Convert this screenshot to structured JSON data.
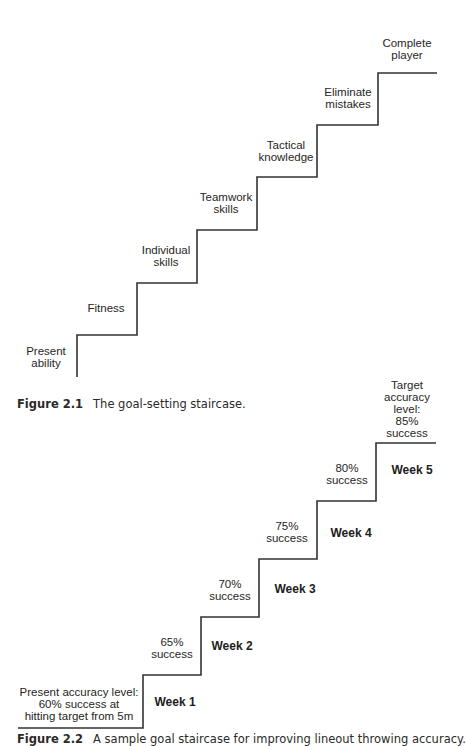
{
  "figure1": {
    "caption": {
      "number": "Figure 2.1",
      "text": "The goal-setting staircase."
    },
    "steps": [
      {
        "label": "Present\nability"
      },
      {
        "label": "Fitness"
      },
      {
        "label": "Individual\nskills"
      },
      {
        "label": "Teamwork\nskills"
      },
      {
        "label": "Tactical\nknowledge"
      },
      {
        "label": "Eliminate\nmistakes"
      },
      {
        "label": "Complete\nplayer"
      }
    ]
  },
  "figure2": {
    "caption": {
      "number": "Figure 2.2",
      "text": "A sample goal staircase for improving lineout throwing accuracy."
    },
    "start_label": "Present accuracy level:\n60% success at\nhitting target from 5m",
    "target_label": "Target\naccuracy\nlevel:\n85%\nsuccess",
    "steps": [
      {
        "week": "Week 1",
        "label": "65%\nsuccess"
      },
      {
        "week": "Week 2",
        "label": "70%\nsuccess"
      },
      {
        "week": "Week 3",
        "label": "75%\nsuccess"
      },
      {
        "week": "Week 4",
        "label": "80%\nsuccess"
      },
      {
        "week": "Week 5"
      }
    ]
  },
  "colors": {
    "line": "#333333",
    "text": "#222222"
  }
}
